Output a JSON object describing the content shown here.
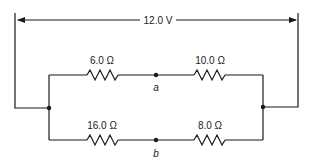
{
  "diagram": {
    "type": "circuit",
    "source_label": "12.0 V",
    "resistors": {
      "top_left": "6.0 Ω",
      "top_right": "10.0 Ω",
      "bottom_left": "16.0 Ω",
      "bottom_right": "8.0 Ω"
    },
    "nodes": {
      "a": "a",
      "b": "b"
    }
  }
}
